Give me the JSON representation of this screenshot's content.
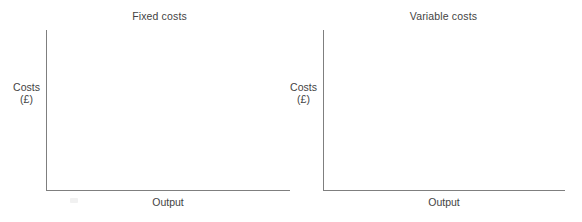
{
  "page": {
    "background_color": "#ffffff",
    "axis_color": "#7f7f7f",
    "text_color": "#434343"
  },
  "charts": [
    {
      "id": "fixed-costs",
      "title": "Fixed costs",
      "ylabel": "Costs",
      "yunit": "(£)",
      "xlabel": "Output"
    },
    {
      "id": "variable-costs",
      "title": "Variable costs",
      "ylabel": "Costs",
      "yunit": "(£)",
      "xlabel": "Output"
    }
  ],
  "chart_data": [
    {
      "type": "line",
      "title": "Fixed costs",
      "xlabel": "Output",
      "ylabel": "Costs (£)",
      "series": [],
      "x": [],
      "values": [],
      "xlim": [
        0,
        1
      ],
      "ylim": [
        0,
        1
      ],
      "grid": false,
      "legend": false,
      "ticks": {
        "x": [],
        "y": []
      },
      "annotations": [],
      "note": "Empty axes template — no data plotted; blank grid for learner to draw the fixed cost curve."
    },
    {
      "type": "line",
      "title": "Variable costs",
      "xlabel": "Output",
      "ylabel": "Costs (£)",
      "series": [],
      "x": [],
      "values": [],
      "xlim": [
        0,
        1
      ],
      "ylim": [
        0,
        1
      ],
      "grid": false,
      "legend": false,
      "ticks": {
        "x": [],
        "y": []
      },
      "annotations": [],
      "note": "Empty axes template — no data plotted; blank grid for learner to draw the variable cost curve."
    }
  ]
}
